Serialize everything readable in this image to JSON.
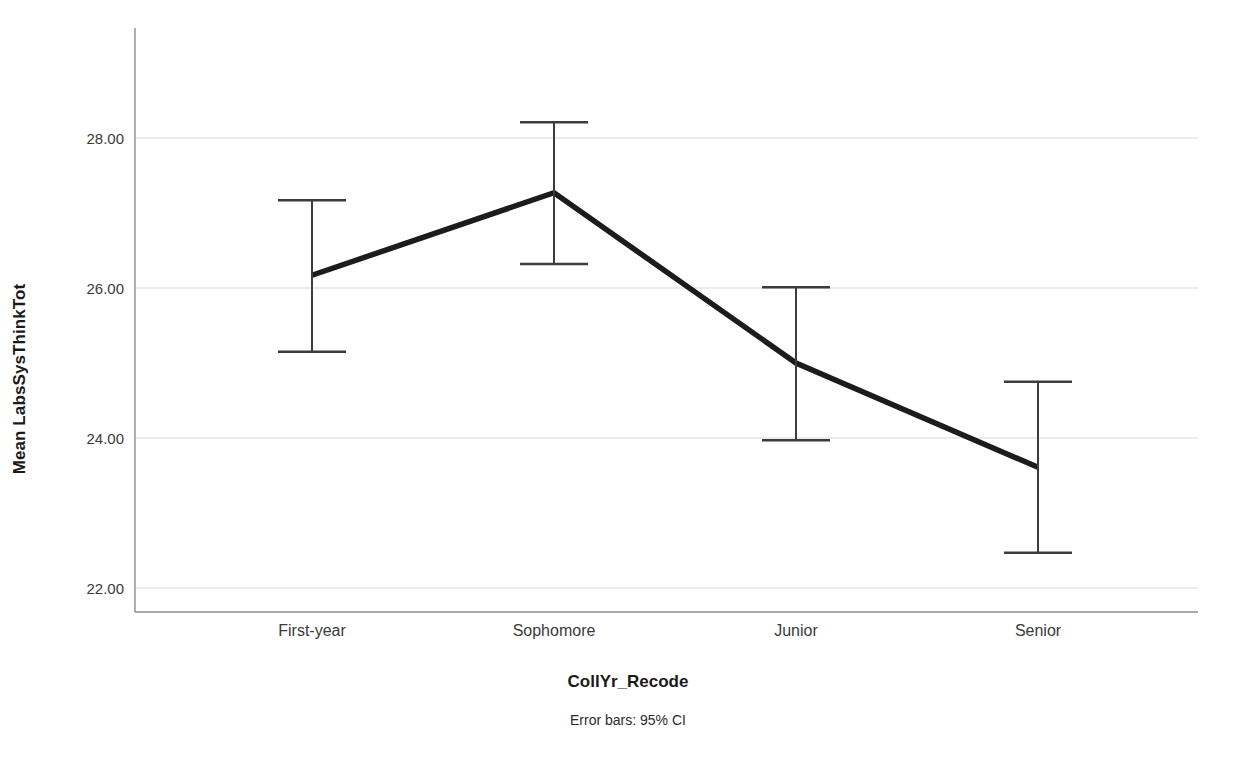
{
  "chart_data": {
    "type": "line",
    "title": "",
    "subtitle": "",
    "xlabel": "CollYr_Recode",
    "ylabel": "Mean LabsSysThinkTot",
    "footnote": "Error bars: 95% CI",
    "categories": [
      "First-year",
      "Sophomore",
      "Junior",
      "Senior"
    ],
    "values": [
      26.17,
      27.27,
      25.0,
      23.61
    ],
    "error_low": [
      25.15,
      26.32,
      23.97,
      22.47
    ],
    "error_high": [
      27.17,
      28.21,
      26.01,
      24.75
    ],
    "error_type": "95% CI",
    "ylim": [
      21.4,
      29.0
    ],
    "yticks": [
      22.0,
      24.0,
      26.0,
      28.0
    ],
    "ytick_labels": [
      "22.00",
      "24.00",
      "26.00",
      "28.00"
    ],
    "grid": true,
    "grid_axis": "y",
    "legend": "none",
    "series": [
      {
        "name": "Mean LabsSysThinkTot",
        "values": [
          26.17,
          27.27,
          25.0,
          23.61
        ],
        "color": "#1c1c1c"
      }
    ],
    "colors": {
      "line": "#1c1c1c",
      "error_bar": "#3c3c3c",
      "grid": "#d9d9d9",
      "axis": "#7a7a7a",
      "text": "#2b2b2b"
    }
  },
  "axis": {
    "y_title": "Mean LabsSysThinkTot",
    "x_title": "CollYr_Recode",
    "y_labels": [
      "28.00",
      "26.00",
      "24.00",
      "22.00"
    ],
    "x_labels": [
      "First-year",
      "Sophomore",
      "Junior",
      "Senior"
    ]
  },
  "notes": {
    "error_bars": "Error bars: 95% CI"
  }
}
